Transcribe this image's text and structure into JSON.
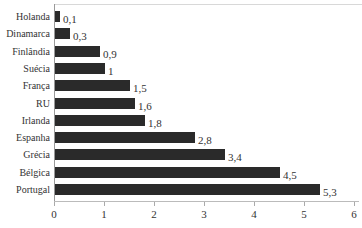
{
  "chart_data": {
    "type": "bar",
    "orientation": "horizontal",
    "title": "",
    "xlabel": "",
    "ylabel": "",
    "xlim": [
      0,
      6
    ],
    "x_ticks": [
      "0",
      "1",
      "2",
      "3",
      "4",
      "5",
      "6"
    ],
    "grid": false,
    "legend": null,
    "bar_color": "#2a2a2a",
    "categories": [
      "Holanda",
      "Dinamarca",
      "Finlândia",
      "Suécia",
      "França",
      "RU",
      "Irlanda",
      "Espanha",
      "Grécia",
      "Bélgica",
      "Portugal"
    ],
    "values": [
      0.1,
      0.3,
      0.9,
      1,
      1.5,
      1.6,
      1.8,
      2.8,
      3.4,
      4.5,
      5.3
    ],
    "value_labels": [
      "0,1",
      "0,3",
      "0,9",
      "1",
      "1,5",
      "1,6",
      "1,8",
      "2,8",
      "3,4",
      "4,5",
      "5,3"
    ]
  }
}
